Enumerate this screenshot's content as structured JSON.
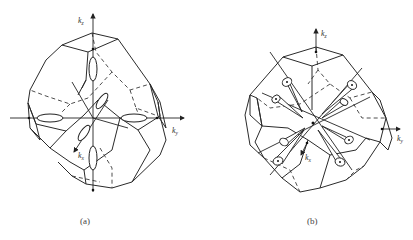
{
  "figure": {
    "panels": [
      {
        "id": "a",
        "caption": "(a)",
        "description": "Brillouin zone (truncated octahedron) with ellipsoidal constant-energy surfaces along k-axes",
        "axes": {
          "kz": "k",
          "kz_sub": "z",
          "ky": "k",
          "ky_sub": "y",
          "kx": "k",
          "kx_sub": "x"
        },
        "pocket_shape": "ellipsoid",
        "pocket_count": 6
      },
      {
        "id": "b",
        "caption": "(b)",
        "description": "Brillouin zone (truncated octahedron) with ellipsoidal pockets along [111] directions",
        "axes": {
          "kz": "k",
          "kz_sub": "z",
          "ky": "k",
          "ky_sub": "y",
          "kx": "k",
          "kx_sub": "x"
        },
        "pocket_shape": "half-ellipsoid cone",
        "pocket_count": 8
      }
    ]
  }
}
